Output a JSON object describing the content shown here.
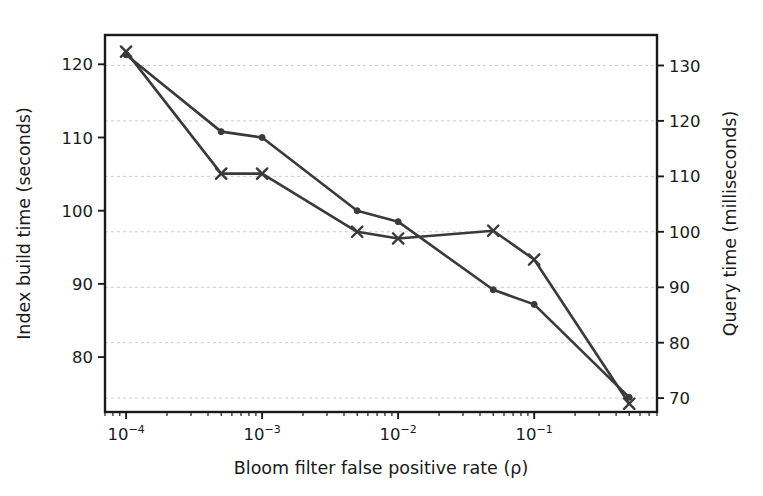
{
  "chart_data": {
    "type": "line",
    "title": "",
    "xlabel": "Bloom filter false positive rate (ρ)",
    "ylabel": "Index build time (seconds)",
    "y2label": "Query time (milliseconds)",
    "xscale": "log",
    "xlim": [
      7e-05,
      0.8
    ],
    "ylim": [
      72.5,
      124.0
    ],
    "y2lim": [
      67.5,
      135.5
    ],
    "grid": true,
    "legend_position": "none",
    "x": [
      0.0001,
      0.0005,
      0.001,
      0.005,
      0.01,
      0.05,
      0.1,
      0.5
    ],
    "xtick_labels": [
      "10",
      "10",
      "10",
      "10"
    ],
    "xtick_exponents": [
      "−4",
      "−3",
      "−2",
      "−1"
    ],
    "xtick_values": [
      0.0001,
      0.001,
      0.01,
      0.1
    ],
    "ytick_labels": [
      "80",
      "90",
      "100",
      "110",
      "120"
    ],
    "ytick_values": [
      80,
      90,
      100,
      110,
      120
    ],
    "y2tick_labels": [
      "70",
      "80",
      "90",
      "100",
      "110",
      "120",
      "130"
    ],
    "y2tick_values": [
      70,
      80,
      90,
      100,
      110,
      120,
      130
    ],
    "series": [
      {
        "name": "Index build time (seconds)",
        "axis": "left",
        "marker": "circle",
        "color": "#3a3a3a",
        "values": [
          121.3,
          110.8,
          110.0,
          100.0,
          98.5,
          89.2,
          87.2,
          74.5
        ]
      },
      {
        "name": "Query time (milliseconds)",
        "axis": "right",
        "marker": "x",
        "color": "#3a3a3a",
        "values": [
          132.5,
          110.5,
          110.5,
          100.0,
          98.8,
          100.2,
          95.0,
          69.0
        ]
      }
    ]
  },
  "figure": {
    "background_color": "#ffffff",
    "axes_color": "#1a1a1a",
    "grid_color": "#c8c8c8",
    "line_color": "#3a3a3a"
  }
}
